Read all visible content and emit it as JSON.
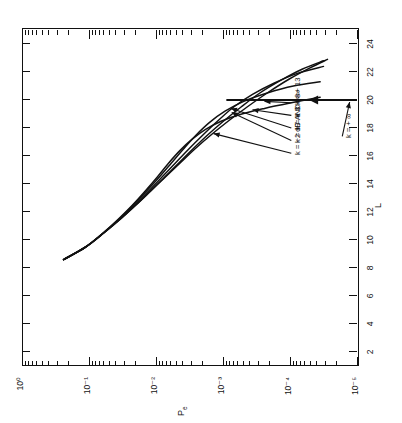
{
  "figure": {
    "kind": "semilog-plot",
    "rotation_deg": -90,
    "background": "#ffffff",
    "ink_color": "#111111"
  },
  "chart_data": {
    "type": "line",
    "title": "",
    "xlabel": "L",
    "ylabel": "P_e",
    "ylabel_display": "P",
    "ylabel_sub": "e",
    "xlim": [
      1,
      25
    ],
    "ylim_exponents": [
      0,
      -5
    ],
    "yscale": "log",
    "grid": false,
    "legend": "inline-annotations",
    "xticks": [
      2,
      4,
      6,
      8,
      10,
      12,
      14,
      16,
      18,
      20,
      22,
      24
    ],
    "xticklabels": [
      "2",
      "4",
      "6",
      "8",
      "10",
      "12",
      "14",
      "16",
      "18",
      "20",
      "22",
      "24"
    ],
    "yticks_exponents": [
      0,
      -1,
      -2,
      -3,
      -4,
      -5
    ],
    "yticklabels": [
      "10⁰",
      "10⁻¹",
      "10⁻²",
      "10⁻³",
      "10⁻⁴",
      "10⁻⁵"
    ],
    "y_minor_ticks": true,
    "x_minor_ticks": false,
    "series": [
      {
        "name": "k = −2 dB",
        "label": "k = −2 dB",
        "points": [
          [
            8.6,
            -0.62
          ],
          [
            9.5,
            -0.95
          ],
          [
            10.5,
            -1.22
          ],
          [
            11.5,
            -1.47
          ],
          [
            12.5,
            -1.7
          ],
          [
            13.5,
            -1.92
          ],
          [
            14.5,
            -2.14
          ],
          [
            15.5,
            -2.36
          ],
          [
            16.5,
            -2.58
          ],
          [
            17.5,
            -2.82
          ],
          [
            18.5,
            -3.08
          ],
          [
            19.5,
            -3.36
          ],
          [
            20.5,
            -3.66
          ],
          [
            21.5,
            -3.99
          ],
          [
            22.3,
            -4.3
          ],
          [
            22.9,
            -4.56
          ]
        ]
      },
      {
        "name": "k = −7 AND −∞",
        "label": "k = −7 AND − ∞",
        "points": [
          [
            8.6,
            -0.62
          ],
          [
            9.5,
            -0.95
          ],
          [
            10.5,
            -1.22
          ],
          [
            11.5,
            -1.47
          ],
          [
            12.5,
            -1.7
          ],
          [
            13.5,
            -1.92
          ],
          [
            14.5,
            -2.13
          ],
          [
            15.5,
            -2.34
          ],
          [
            16.5,
            -2.55
          ],
          [
            17.5,
            -2.77
          ],
          [
            18.5,
            -3.01
          ],
          [
            19.5,
            -3.27
          ],
          [
            20.5,
            -3.55
          ],
          [
            21.4,
            -3.86
          ],
          [
            22.2,
            -4.18
          ],
          [
            22.8,
            -4.5
          ]
        ]
      },
      {
        "name": "k = +3",
        "label": "k = + 3",
        "points": [
          [
            8.6,
            -0.62
          ],
          [
            9.5,
            -0.95
          ],
          [
            10.5,
            -1.22
          ],
          [
            11.5,
            -1.46
          ],
          [
            12.5,
            -1.68
          ],
          [
            13.5,
            -1.89
          ],
          [
            14.5,
            -2.09
          ],
          [
            15.5,
            -2.29
          ],
          [
            16.5,
            -2.49
          ],
          [
            17.5,
            -2.7
          ],
          [
            18.5,
            -2.92
          ],
          [
            19.5,
            -3.16
          ],
          [
            20.4,
            -3.44
          ],
          [
            21.2,
            -3.76
          ],
          [
            21.9,
            -4.11
          ],
          [
            22.4,
            -4.5
          ]
        ]
      },
      {
        "name": "k = +8",
        "label": "k = + 8",
        "points": [
          [
            8.6,
            -0.62
          ],
          [
            9.5,
            -0.95
          ],
          [
            10.5,
            -1.21
          ],
          [
            11.5,
            -1.45
          ],
          [
            12.5,
            -1.66
          ],
          [
            13.5,
            -1.86
          ],
          [
            14.5,
            -2.05
          ],
          [
            15.5,
            -2.23
          ],
          [
            16.5,
            -2.41
          ],
          [
            17.5,
            -2.6
          ],
          [
            18.4,
            -2.8
          ],
          [
            19.2,
            -3.03
          ],
          [
            19.9,
            -3.31
          ],
          [
            20.5,
            -3.66
          ],
          [
            21.0,
            -4.05
          ],
          [
            21.3,
            -4.45
          ]
        ]
      },
      {
        "name": "k = +13",
        "label": "k = + 13",
        "points": [
          [
            8.6,
            -0.62
          ],
          [
            9.5,
            -0.95
          ],
          [
            10.5,
            -1.21
          ],
          [
            11.5,
            -1.44
          ],
          [
            12.5,
            -1.65
          ],
          [
            13.5,
            -1.84
          ],
          [
            14.5,
            -2.02
          ],
          [
            15.5,
            -2.19
          ],
          [
            16.4,
            -2.36
          ],
          [
            17.2,
            -2.54
          ],
          [
            17.9,
            -2.74
          ],
          [
            18.5,
            -2.98
          ],
          [
            19.0,
            -3.28
          ],
          [
            19.4,
            -3.62
          ],
          [
            19.8,
            -4.02
          ],
          [
            20.2,
            -4.45
          ]
        ]
      }
    ],
    "asymptote": {
      "label": "k = + ∞",
      "L_value": 20,
      "style": "vertical-asymptote-with-arrow"
    },
    "annotations": [
      {
        "text": "k = −2 dB",
        "target_series": "k = −2 dB"
      },
      {
        "text": "k = −7 AND − ∞",
        "target_series": "k = −7 AND −∞"
      },
      {
        "text": "k = + 3",
        "target_series": "k = +3"
      },
      {
        "text": "k = + 8",
        "target_series": "k = +8"
      },
      {
        "text": "k = + 13",
        "target_series": "k = +13"
      },
      {
        "text": "k = + ∞",
        "target_series": "asymptote"
      }
    ]
  }
}
